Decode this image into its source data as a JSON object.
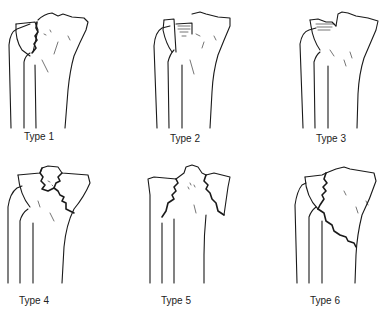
{
  "figure": {
    "panels": [
      {
        "id": 1,
        "label": "Type 1"
      },
      {
        "id": 2,
        "label": "Type 2"
      },
      {
        "id": 3,
        "label": "Type 3"
      },
      {
        "id": 4,
        "label": "Type 4"
      },
      {
        "id": 5,
        "label": "Type 5"
      },
      {
        "id": 6,
        "label": "Type 6"
      }
    ]
  }
}
